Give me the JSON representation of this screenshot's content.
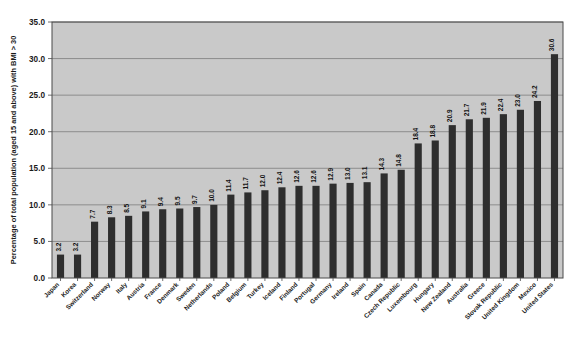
{
  "chart_data": {
    "type": "bar",
    "title": "",
    "xlabel": "",
    "ylabel": "Percentage of total population (aged 15 and above) with BMI > 30",
    "ylim": [
      0.0,
      35.0
    ],
    "ytick_labels": [
      "0.0",
      "5.0",
      "10.0",
      "15.0",
      "20.0",
      "25.0",
      "30.0",
      "35.0"
    ],
    "ytick_values": [
      0.0,
      5.0,
      10.0,
      15.0,
      20.0,
      25.0,
      30.0,
      35.0
    ],
    "grid": true,
    "legend": false,
    "legend_position": "none",
    "categories": [
      "Japan",
      "Korea",
      "Switzerland",
      "Norway",
      "Italy",
      "Austria",
      "France",
      "Denmark",
      "Sweden",
      "Netherlands",
      "Poland",
      "Belgium",
      "Turkey",
      "Iceland",
      "Finland",
      "Portugal",
      "Germany",
      "Ireland",
      "Spain",
      "Canada",
      "Czech Republic",
      "Luxembourg",
      "Hungary",
      "New Zealand",
      "Australia",
      "Greece",
      "Slovak Republic",
      "United Kingdom",
      "Mexico",
      "United States"
    ],
    "values": [
      3.2,
      3.2,
      7.7,
      8.3,
      8.5,
      9.1,
      9.4,
      9.5,
      9.7,
      10.0,
      11.4,
      11.7,
      12.0,
      12.4,
      12.6,
      12.6,
      12.9,
      13.0,
      13.1,
      14.3,
      14.8,
      18.4,
      18.8,
      20.9,
      21.7,
      21.9,
      22.4,
      23.0,
      24.2,
      30.6
    ],
    "value_labels": [
      "3.2",
      "3.2",
      "7.7",
      "8.3",
      "8.5",
      "9.1",
      "9.4",
      "9.5",
      "9.7",
      "10.0",
      "11.4",
      "11.7",
      "12.0",
      "12.4",
      "12.6",
      "12.6",
      "12.9",
      "13.0",
      "13.1",
      "14.3",
      "14.8",
      "18.4",
      "18.8",
      "20.9",
      "21.7",
      "21.9",
      "22.4",
      "23.0",
      "24.2",
      "30.6"
    ],
    "colors": {
      "bar": "#2e2e2e",
      "plot_background": "#c9c9c9",
      "figure_background": "#ffffff",
      "grid": "#7d7d7d",
      "frame": "#4a4a4a",
      "text": "#1a1a1a"
    }
  }
}
